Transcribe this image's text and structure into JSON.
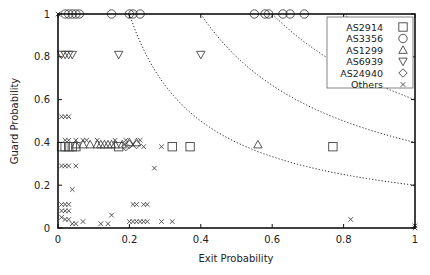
{
  "chart_data": {
    "type": "scatter",
    "title": "",
    "xlabel": "Exit Probability",
    "ylabel": "Guard Probability",
    "xlim": [
      0,
      1
    ],
    "ylim": [
      0,
      1
    ],
    "xticks": [
      "0",
      "0.2",
      "0.4",
      "0.6",
      "0.8",
      "1"
    ],
    "yticks": [
      "0",
      "0.2",
      "0.4",
      "0.6",
      "0.8",
      "1"
    ],
    "grid": false,
    "legend_position": "upper right",
    "iso_curves": [
      {
        "type": "x*y=c",
        "c": 0.2,
        "style": "dotted"
      },
      {
        "type": "x*y=c",
        "c": 0.4,
        "style": "dotted"
      },
      {
        "type": "x*y=c",
        "c": 0.6,
        "style": "dotted"
      },
      {
        "type": "x*y=c",
        "c": 0.8,
        "style": "dotted"
      }
    ],
    "series": [
      {
        "name": "AS2914",
        "marker": "square",
        "points": [
          [
            0.01,
            0.38
          ],
          [
            0.02,
            0.38
          ],
          [
            0.03,
            0.38
          ],
          [
            0.04,
            0.38
          ],
          [
            0.05,
            0.38
          ],
          [
            0.17,
            0.38
          ],
          [
            0.32,
            0.38
          ],
          [
            0.37,
            0.38
          ],
          [
            0.77,
            0.38
          ]
        ]
      },
      {
        "name": "AS3356",
        "marker": "circle",
        "points": [
          [
            0.02,
            1
          ],
          [
            0.03,
            1
          ],
          [
            0.04,
            1
          ],
          [
            0.05,
            1
          ],
          [
            0.06,
            1
          ],
          [
            0.15,
            1
          ],
          [
            0.2,
            1
          ],
          [
            0.21,
            1
          ],
          [
            0.23,
            1
          ],
          [
            0.55,
            1
          ],
          [
            0.58,
            1
          ],
          [
            0.59,
            1
          ],
          [
            0.63,
            1
          ],
          [
            0.65,
            1
          ],
          [
            0.69,
            1
          ]
        ]
      },
      {
        "name": "AS1299",
        "marker": "triangle-up",
        "points": [
          [
            0.05,
            0.39
          ],
          [
            0.07,
            0.39
          ],
          [
            0.09,
            0.39
          ],
          [
            0.11,
            0.39
          ],
          [
            0.12,
            0.39
          ],
          [
            0.13,
            0.39
          ],
          [
            0.14,
            0.39
          ],
          [
            0.15,
            0.39
          ],
          [
            0.16,
            0.39
          ],
          [
            0.18,
            0.39
          ],
          [
            0.2,
            0.4
          ],
          [
            0.22,
            0.4
          ],
          [
            0.56,
            0.39
          ]
        ]
      },
      {
        "name": "AS6939",
        "marker": "triangle-down",
        "points": [
          [
            0.01,
            0.81
          ],
          [
            0.02,
            0.81
          ],
          [
            0.03,
            0.81
          ],
          [
            0.04,
            0.81
          ],
          [
            0.17,
            0.81
          ],
          [
            0.4,
            0.81
          ]
        ]
      },
      {
        "name": "AS24940",
        "marker": "diamond",
        "points": [
          [
            0.19,
            0.38
          ],
          [
            0.2,
            0.39
          ],
          [
            0.22,
            0.39
          ]
        ]
      },
      {
        "name": "Others",
        "marker": "x",
        "points": [
          [
            0.0,
            1
          ],
          [
            0.01,
            0.52
          ],
          [
            0.02,
            0.52
          ],
          [
            0.03,
            0.52
          ],
          [
            0.02,
            0.41
          ],
          [
            0.03,
            0.41
          ],
          [
            0.05,
            0.41
          ],
          [
            0.07,
            0.41
          ],
          [
            0.08,
            0.41
          ],
          [
            0.11,
            0.41
          ],
          [
            0.16,
            0.41
          ],
          [
            0.19,
            0.41
          ],
          [
            0.21,
            0.39
          ],
          [
            0.23,
            0.41
          ],
          [
            0.24,
            0.38
          ],
          [
            0.29,
            0.38
          ],
          [
            0.01,
            0.29
          ],
          [
            0.02,
            0.29
          ],
          [
            0.03,
            0.29
          ],
          [
            0.05,
            0.29
          ],
          [
            0.27,
            0.28
          ],
          [
            0.04,
            0.18
          ],
          [
            0.01,
            0.11
          ],
          [
            0.02,
            0.11
          ],
          [
            0.03,
            0.11
          ],
          [
            0.01,
            0.08
          ],
          [
            0.02,
            0.08
          ],
          [
            0.03,
            0.08
          ],
          [
            0.21,
            0.11
          ],
          [
            0.22,
            0.11
          ],
          [
            0.24,
            0.11
          ],
          [
            0.25,
            0.11
          ],
          [
            0.15,
            0.06
          ],
          [
            0.01,
            0.05
          ],
          [
            0.02,
            0.04
          ],
          [
            0.03,
            0.04
          ],
          [
            0.04,
            0.02
          ],
          [
            0.05,
            0.02
          ],
          [
            0.07,
            0.03
          ],
          [
            0.12,
            0.02
          ],
          [
            0.14,
            0.02
          ],
          [
            0.2,
            0.03
          ],
          [
            0.21,
            0.03
          ],
          [
            0.22,
            0.03
          ],
          [
            0.23,
            0.03
          ],
          [
            0.24,
            0.03
          ],
          [
            0.25,
            0.03
          ],
          [
            0.29,
            0.03
          ],
          [
            0.32,
            0.03
          ],
          [
            0.82,
            0.04
          ],
          [
            1.0,
            0.01
          ],
          [
            1.0,
            0.0
          ]
        ]
      }
    ]
  }
}
